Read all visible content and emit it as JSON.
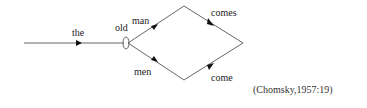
{
  "diagram": {
    "type": "finite-state-diagram",
    "edges": [
      {
        "id": "the",
        "label": "the"
      },
      {
        "id": "old",
        "label": "old"
      },
      {
        "id": "man",
        "label": "man"
      },
      {
        "id": "men",
        "label": "men"
      },
      {
        "id": "comes",
        "label": "comes"
      },
      {
        "id": "come",
        "label": "come"
      }
    ],
    "labels": {
      "the": "the",
      "old": "old",
      "man": "man",
      "men": "men",
      "comes": "comes",
      "come": "come"
    },
    "colors": {
      "line": "#555555",
      "text": "#222222"
    }
  },
  "citation": "(Chomsky,1957:19)"
}
